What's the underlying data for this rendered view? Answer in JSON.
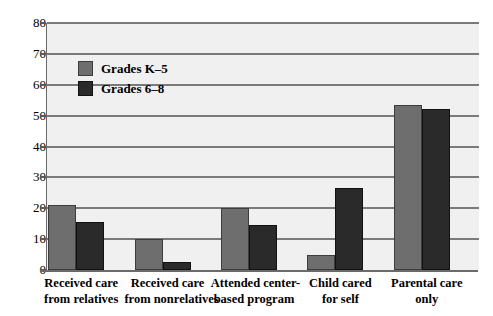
{
  "chart_data": {
    "type": "bar",
    "title": "",
    "xlabel": "",
    "ylabel": "",
    "ylim": [
      0,
      80
    ],
    "yticks": [
      0,
      10,
      20,
      30,
      40,
      50,
      60,
      70,
      80
    ],
    "grid": true,
    "legend_position": "upper-left-inside",
    "categories": [
      "Received care from relatives",
      "Received care from nonrelatives",
      "Attended center-based program",
      "Child cared for self",
      "Parental care only"
    ],
    "category_lines": [
      [
        "Received care",
        "from relatives"
      ],
      [
        "Received care",
        "from nonrelatives"
      ],
      [
        "Attended center-",
        "based program"
      ],
      [
        "Child cared",
        "for self"
      ],
      [
        "Parental care",
        "only"
      ]
    ],
    "series": [
      {
        "name": "Grades K–5",
        "color": "#6e6e6e",
        "values": [
          21,
          10,
          20,
          5,
          53.5
        ]
      },
      {
        "name": "Grades 6–8",
        "color": "#2a2a2a",
        "values": [
          15.5,
          2.5,
          14.5,
          26.5,
          52
        ]
      }
    ]
  },
  "legend": {
    "items": [
      {
        "label": "Grades K–5",
        "swatch": "k5"
      },
      {
        "label": "Grades 6–8",
        "swatch": "g68"
      }
    ]
  },
  "axis": {
    "tick_labels": [
      "80",
      "70",
      "60",
      "50",
      "40",
      "30",
      "20",
      "10",
      "0"
    ]
  },
  "colors": {
    "series_k5": "#6e6e6e",
    "series_g68": "#2a2a2a",
    "plot_background": "#f0f0f0",
    "gridline": "#7a7a7a",
    "axis": "#6a6a6a"
  }
}
